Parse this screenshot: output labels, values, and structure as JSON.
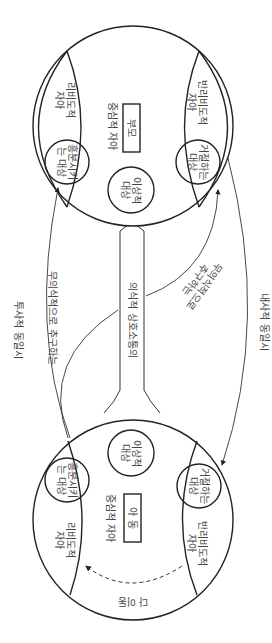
{
  "diagram": {
    "orientation": "rotated 90deg clockwise",
    "top_circle": {
      "central_ego": "중심적 자아",
      "central_object": "부모",
      "ideal_object": "이상적\n대상",
      "libidinal_ego": "리비도적\n자아",
      "exciting_object": "흥분시키\n는 대상",
      "antilibidinal_ego": "반리비도적\n자아",
      "rejecting_object": "거절하는\n대상"
    },
    "bottom_circle": {
      "central_ego": "중심적 자아",
      "central_object": "아 동",
      "ideal_object": "이상적\n대상",
      "libidinal_ego": "리비도적\n자아",
      "exciting_object": "흥분시키\n는 대상",
      "antilibidinal_ego": "반리비도적\n자아",
      "rejecting_object": "거절하는\n대상",
      "bottom_label": "다 이동"
    },
    "connector_label": "의식적 상호소통의",
    "left_outer_label": "투사적 동일시",
    "left_inner_label": "무의식적으로 추구하는",
    "right_inner_label": "무의식적으로\n추구하는",
    "right_outer_label": "내사적 동일시"
  }
}
